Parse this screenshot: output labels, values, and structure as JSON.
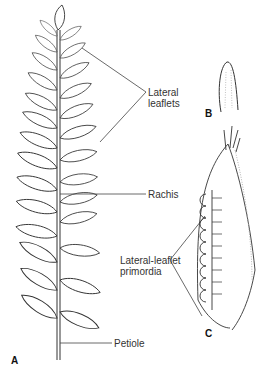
{
  "figure": {
    "panels": [
      {
        "id": "A",
        "label": "A",
        "description": "compound leaf with lateral leaflets"
      },
      {
        "id": "B",
        "label": "B",
        "description": "young leaf primordium tip"
      },
      {
        "id": "C",
        "label": "C",
        "description": "developing leaf with lateral-leaflet primordia"
      }
    ],
    "labels": {
      "lateral_leaflets_1": "Lateral",
      "lateral_leaflets_2": "leaflets",
      "rachis": "Rachis",
      "primordia_1": "Lateral-leaflet",
      "primordia_2": "primordia",
      "petiole": "Petiole"
    },
    "colors": {
      "line": "#333333",
      "background": "#ffffff"
    }
  }
}
